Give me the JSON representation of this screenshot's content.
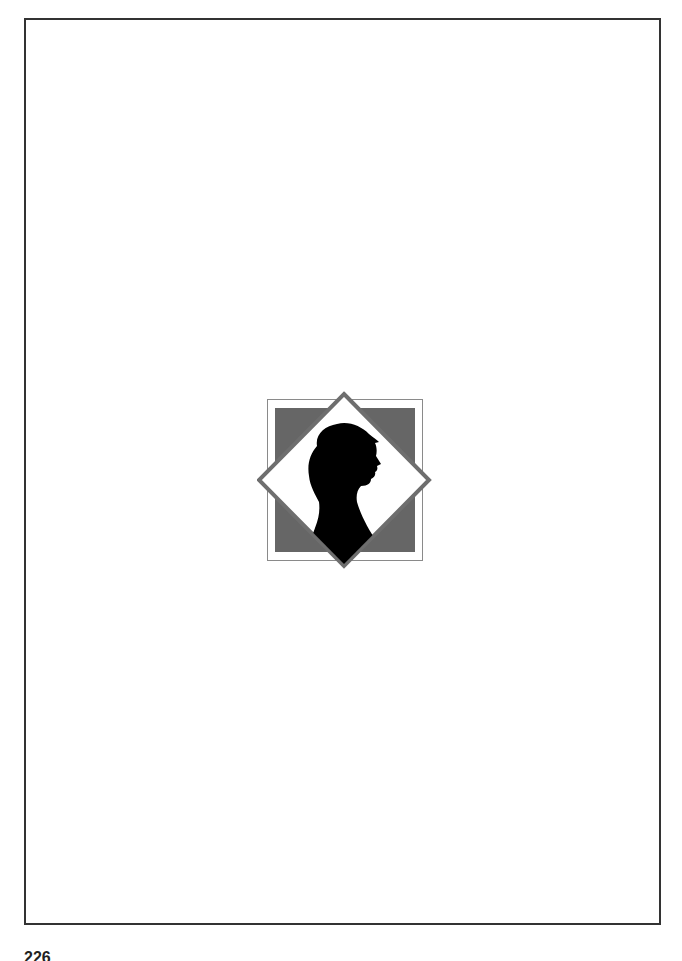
{
  "page": {
    "number_partial": "226"
  },
  "emblem": {
    "name": "silhouette-portrait-emblem",
    "colors": {
      "outer_square_border": "#8a8a8a",
      "inner_square_fill": "#666666",
      "diamond_border": "#6e6e6e",
      "diamond_fill": "#ffffff",
      "silhouette": "#000000"
    }
  }
}
